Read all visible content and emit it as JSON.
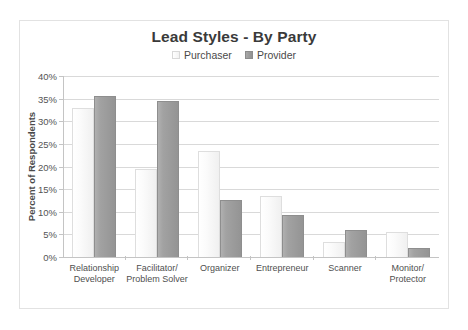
{
  "chart_data": {
    "type": "bar",
    "title": "Lead Styles - By Party",
    "xlabel": "",
    "ylabel": "Percent of Respondents",
    "ylim": [
      0,
      40
    ],
    "ytick_labels": [
      "40%",
      "35%",
      "30%",
      "25%",
      "20%",
      "15%",
      "10%",
      "5%",
      "0%"
    ],
    "ytick_values": [
      40,
      35,
      30,
      25,
      20,
      15,
      10,
      5,
      0
    ],
    "grid": true,
    "legend_position": "top-center",
    "categories": [
      "Relationship Developer",
      "Facilitator/ Problem Solver",
      "Organizer",
      "Entrepreneur",
      "Scanner",
      "Monitor/ Protector"
    ],
    "category_lines": [
      [
        "Relationship",
        "Developer"
      ],
      [
        "Facilitator/",
        "Problem Solver"
      ],
      [
        "Organizer",
        ""
      ],
      [
        "Entrepreneur",
        ""
      ],
      [
        "Scanner",
        ""
      ],
      [
        "Monitor/",
        "Protector"
      ]
    ],
    "series": [
      {
        "name": "Purchaser",
        "color": "#f5f5f5",
        "values": [
          33.0,
          19.5,
          23.5,
          13.5,
          3.3,
          5.5
        ]
      },
      {
        "name": "Provider",
        "color": "#9a9a9a",
        "values": [
          35.6,
          34.5,
          12.5,
          9.3,
          6.0,
          2.0
        ]
      }
    ]
  },
  "legend": {
    "entries": [
      {
        "label": "Purchaser",
        "swatch": "purchaser"
      },
      {
        "label": "Provider",
        "swatch": "provider"
      }
    ]
  }
}
